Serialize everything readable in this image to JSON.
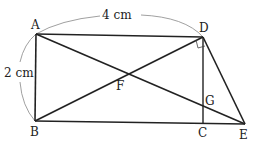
{
  "figure": {
    "points": {
      "A": "A",
      "B": "B",
      "C": "C",
      "D": "D",
      "E": "E",
      "F": "F",
      "G": "G"
    },
    "dimensions": {
      "AD": "4 cm",
      "AB": "2 cm"
    },
    "right_angle_at": "D",
    "colors": {
      "line": "#222222",
      "arc": "#888888"
    }
  }
}
